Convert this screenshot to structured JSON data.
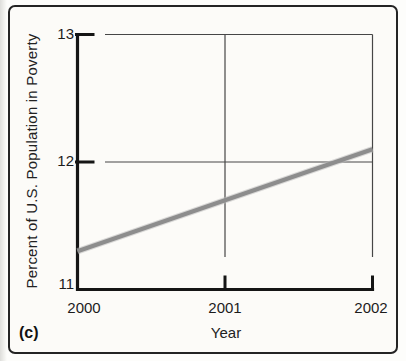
{
  "panel": {
    "label": "(c)"
  },
  "chart_data": {
    "type": "line",
    "title": "",
    "xlabel": "Year",
    "ylabel": "Percent of U.S. Population in Poverty",
    "x": [
      2000,
      2001,
      2002
    ],
    "series": [
      {
        "name": "U.S. poverty rate",
        "values": [
          11.3,
          11.7,
          12.1
        ],
        "color": "#8d8d8d"
      }
    ],
    "xlim": [
      2000,
      2002
    ],
    "ylim": [
      11,
      13
    ],
    "xticks": [
      "2000",
      "2001",
      "2002"
    ],
    "yticks": [
      "11",
      "12",
      "13"
    ],
    "grid": true,
    "legend": "none",
    "axis_color": "#151515",
    "grid_color": "#464646",
    "frame_color": "#242424"
  }
}
